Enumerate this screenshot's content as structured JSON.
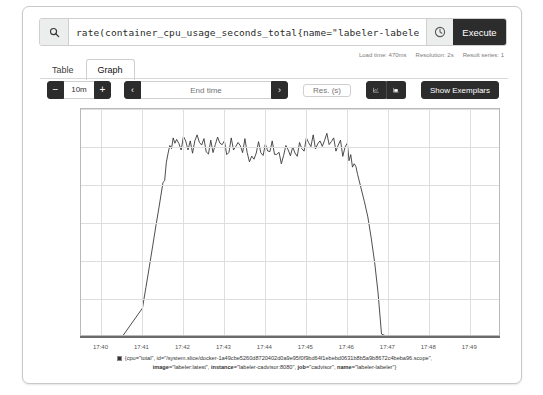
{
  "query": {
    "value": "rate(container_cpu_usage_seconds_total{name=\"labeler-labeler\"}[1m])",
    "placeholder": "Expression (press Shift+Enter for newlines)",
    "search_icon": "search-icon",
    "history_icon": "history-clock-icon",
    "execute_label": "Execute"
  },
  "meta": {
    "load_time": "Load time: 470ms",
    "resolution": "Resolution: 2s",
    "result_series": "Result series: 1"
  },
  "tabs": [
    {
      "label": "Table",
      "active": false
    },
    {
      "label": "Graph",
      "active": true
    }
  ],
  "controls": {
    "range_minus": "−",
    "range_value": "10m",
    "range_plus": "+",
    "nav_prev": "‹",
    "end_time_placeholder": "End time",
    "end_time_value": "",
    "nav_next": "›",
    "resolution_placeholder": "Res. (s)",
    "resolution_value": "",
    "chart_type_line_icon": "line-chart-icon",
    "chart_type_stacked_icon": "stacked-chart-icon",
    "show_exemplars_label": "Show Exemplars"
  },
  "legend": {
    "swatch_color": "#333333",
    "line1": "{cpu=\"total\", id=\"/system.slice/docker-1a49cbe5260d8720402d0a9e95f0f9bd64f1ebebd0631b8b5a9b8672c4beba96.scope\",",
    "line2_parts": [
      {
        "key": "image=",
        "value": "\"labeler:latest\", "
      },
      {
        "key": "instance=",
        "value": "\"labeler-cadvisor:8080\", "
      },
      {
        "key": "job=",
        "value": "\"cadvisor\", "
      },
      {
        "key": "name=",
        "value": "\"labeler-labeler\"}"
      }
    ]
  },
  "chart_data": {
    "type": "line",
    "title": "",
    "xlabel": "",
    "ylabel": "",
    "grid": true,
    "legend_position": "bottom",
    "line_color": "#3a3a3a",
    "xlim": [
      "17:39:30",
      "17:49:45"
    ],
    "ylim": [
      0.0,
      0.3
    ],
    "ytick_labels": [
      "0.00",
      "0.05",
      "0.10",
      "0.15",
      "0.20",
      "0.25",
      "0.30"
    ],
    "yticks": [
      0.0,
      0.05,
      0.1,
      0.15,
      0.2,
      0.25,
      0.3
    ],
    "xtick_labels": [
      "17:40",
      "17:41",
      "17:42",
      "17:43",
      "17:44",
      "17:45",
      "17:46",
      "17:47",
      "17:48",
      "17:49"
    ],
    "series": [
      {
        "name": "{cpu=\"total\", id=\"/system.slice/docker-1a49cbe5260d8720402d0a9e95f0f9bd64f1ebebd0631b8b5a9b8672c4beba96.scope\", image=\"labeler:latest\", instance=\"labeler-cadvisor:8080\", job=\"cadvisor\", name=\"labeler-labeler\"}",
        "x": [
          "17:39:30",
          "17:40:00",
          "17:40:30",
          "17:41:00",
          "17:41:05",
          "17:41:10",
          "17:41:15",
          "17:41:20",
          "17:41:25",
          "17:41:30",
          "17:41:35",
          "17:41:40",
          "17:41:45",
          "17:41:50",
          "17:42:00",
          "17:42:10",
          "17:42:20",
          "17:42:30",
          "17:42:40",
          "17:42:50",
          "17:43:00",
          "17:43:10",
          "17:43:20",
          "17:43:30",
          "17:43:40",
          "17:43:50",
          "17:44:00",
          "17:44:10",
          "17:44:20",
          "17:44:30",
          "17:44:40",
          "17:44:50",
          "17:45:00",
          "17:45:10",
          "17:45:20",
          "17:45:30",
          "17:45:40",
          "17:45:50",
          "17:46:00",
          "17:46:05",
          "17:46:10",
          "17:46:15",
          "17:46:20",
          "17:46:25",
          "17:46:30",
          "17:46:35",
          "17:46:40",
          "17:46:45",
          "17:46:50",
          "17:47:00",
          "17:48:00",
          "17:49:00",
          "17:49:45"
        ],
        "y": [
          0,
          0,
          0,
          0.038,
          0.065,
          0.092,
          0.12,
          0.148,
          0.175,
          0.203,
          0.23,
          0.252,
          0.262,
          0.26,
          0.264,
          0.258,
          0.266,
          0.261,
          0.259,
          0.263,
          0.258,
          0.262,
          0.256,
          0.261,
          0.238,
          0.257,
          0.254,
          0.258,
          0.243,
          0.252,
          0.25,
          0.256,
          0.262,
          0.266,
          0.258,
          0.268,
          0.262,
          0.259,
          0.255,
          0.24,
          0.228,
          0.214,
          0.196,
          0.178,
          0.158,
          0.13,
          0.098,
          0.058,
          0.004,
          0,
          0,
          0,
          0
        ]
      }
    ]
  }
}
